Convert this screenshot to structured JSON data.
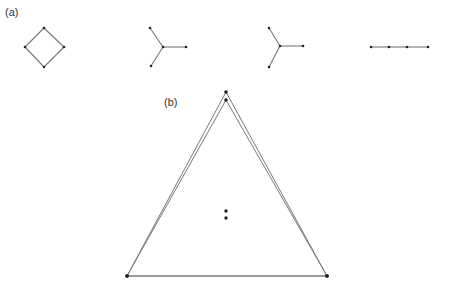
{
  "panel_a": {
    "label": "(a)",
    "shapes": [
      {
        "name": "square-cycle",
        "nodes": [
          [
            44,
            28
          ],
          [
            64,
            47
          ],
          [
            44,
            67
          ],
          [
            25,
            47
          ]
        ],
        "edges": [
          [
            0,
            1
          ],
          [
            1,
            2
          ],
          [
            2,
            3
          ],
          [
            3,
            0
          ]
        ]
      },
      {
        "name": "star-1",
        "nodes": [
          [
            163,
            47
          ],
          [
            150,
            28
          ],
          [
            151,
            66
          ],
          [
            186,
            47
          ]
        ],
        "edges": [
          [
            0,
            1
          ],
          [
            0,
            2
          ],
          [
            0,
            3
          ]
        ]
      },
      {
        "name": "star-2",
        "nodes": [
          [
            280,
            46
          ],
          [
            269,
            28
          ],
          [
            269,
            67
          ],
          [
            303,
            46
          ]
        ],
        "edges": [
          [
            0,
            1
          ],
          [
            0,
            2
          ],
          [
            0,
            3
          ]
        ]
      },
      {
        "name": "path",
        "nodes": [
          [
            371,
            47
          ],
          [
            389,
            47
          ],
          [
            407,
            47
          ],
          [
            428,
            47
          ]
        ],
        "edges": [
          [
            0,
            1
          ],
          [
            1,
            2
          ],
          [
            2,
            3
          ]
        ]
      }
    ]
  },
  "panel_b": {
    "label": "(b)",
    "outer_triangle": [
      [
        226,
        92
      ],
      [
        127,
        276
      ],
      [
        327,
        276
      ]
    ],
    "inner_triangle": [
      [
        226,
        100
      ],
      [
        127,
        276
      ],
      [
        327,
        276
      ]
    ],
    "center_points": [
      [
        226,
        211
      ],
      [
        226,
        218
      ]
    ]
  },
  "colors": {
    "edge": "#777777",
    "node": "#222222"
  }
}
